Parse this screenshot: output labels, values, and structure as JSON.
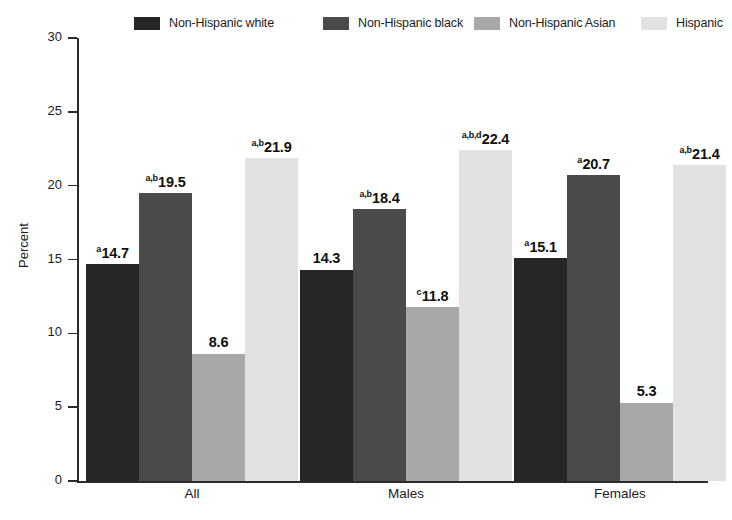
{
  "chart_data": {
    "type": "bar",
    "title": "",
    "xlabel": "",
    "ylabel": "Percent",
    "ylim": [
      0,
      30
    ],
    "yticks": [
      0,
      5,
      10,
      15,
      20,
      25,
      30
    ],
    "ytick_labels": [
      "0",
      "5",
      "10",
      "15",
      "20",
      "25",
      "30"
    ],
    "grid": false,
    "legend_position": "top",
    "categories": [
      "All",
      "Males",
      "Females"
    ],
    "series": [
      {
        "name": "Non-Hispanic white",
        "color": "#262626",
        "values": [
          14.7,
          14.3,
          15.1
        ],
        "labels": [
          "14.7",
          "14.3",
          "15.1"
        ],
        "superscripts": [
          "a",
          "",
          "a"
        ]
      },
      {
        "name": "Non-Hispanic black",
        "color": "#4a4a4a",
        "values": [
          19.5,
          18.4,
          20.7
        ],
        "labels": [
          "19.5",
          "18.4",
          "20.7"
        ],
        "superscripts": [
          "a,b",
          "a,b",
          "a"
        ]
      },
      {
        "name": "Non-Hispanic Asian",
        "color": "#a8a8a8",
        "values": [
          8.6,
          11.8,
          5.3
        ],
        "labels": [
          "8.6",
          "11.8",
          "5.3"
        ],
        "superscripts": [
          "",
          "c",
          ""
        ]
      },
      {
        "name": "Hispanic",
        "color": "#e2e2e2",
        "values": [
          21.9,
          22.4,
          21.4
        ],
        "labels": [
          "21.9",
          "22.4",
          "21.4"
        ],
        "superscripts": [
          "a,b",
          "a,b,d",
          "a,b"
        ]
      }
    ]
  },
  "legend": {
    "items": [
      {
        "label": "Non-Hispanic white",
        "color": "#262626",
        "x": 134
      },
      {
        "label": "Non-Hispanic black",
        "color": "#4a4a4a",
        "x": 323
      },
      {
        "label": "Non-Hispanic Asian",
        "color": "#a8a8a8",
        "x": 474
      },
      {
        "label": "Hispanic",
        "color": "#e2e2e2",
        "x": 641
      }
    ]
  },
  "axes": {
    "y_title": "Percent",
    "y_tick_labels": [
      "30",
      "25",
      "20",
      "15",
      "10",
      "5",
      "0"
    ],
    "x_group_labels": [
      "All",
      "Males",
      "Females"
    ]
  }
}
